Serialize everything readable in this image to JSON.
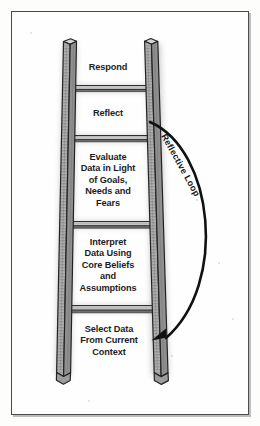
{
  "figure": {
    "background_color": "#fdfdfc",
    "ink_color": "#1d1d1d",
    "frame_color": "#4a4a4a",
    "rail_color": "#9a9a9a"
  },
  "ladder": {
    "rungs": [
      {
        "index": 1,
        "position": "top",
        "name": "respond",
        "lines": [
          "Respond"
        ]
      },
      {
        "index": 2,
        "position": "second",
        "name": "reflect",
        "lines": [
          "Reflect"
        ]
      },
      {
        "index": 3,
        "position": "middle",
        "name": "evaluate",
        "lines": [
          "Evaluate",
          "Data in Light",
          "of Goals,",
          "Needs and",
          "Fears"
        ]
      },
      {
        "index": 4,
        "position": "fourth",
        "name": "interpret",
        "lines": [
          "Interpret",
          "Data Using",
          "Core Beliefs",
          "and",
          "Assumptions"
        ]
      },
      {
        "index": 5,
        "position": "bottom",
        "name": "select-data",
        "lines": [
          "Select Data",
          "From Current",
          "Context"
        ]
      }
    ]
  },
  "loop": {
    "label": "Reflective Loop",
    "from_rung": "Reflect",
    "to_rung": "Select Data From Current Context",
    "direction": "downward",
    "arrowhead": "at bottom pointing left into Select Data rung",
    "color": "#111111"
  }
}
